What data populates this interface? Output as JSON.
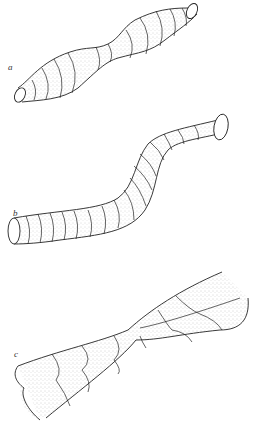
{
  "figure": {
    "panels": [
      {
        "label": "a",
        "description": "tube with alternating bulges and constriction, ringed segments"
      },
      {
        "label": "b",
        "description": "S-curved tube of uniform diameter with ring segments"
      },
      {
        "label": "c",
        "description": "twisted lobed tube narrowing to a waist"
      }
    ]
  },
  "colors": {
    "stroke": "#222222",
    "stipple": "#555555",
    "background": "#ffffff"
  }
}
